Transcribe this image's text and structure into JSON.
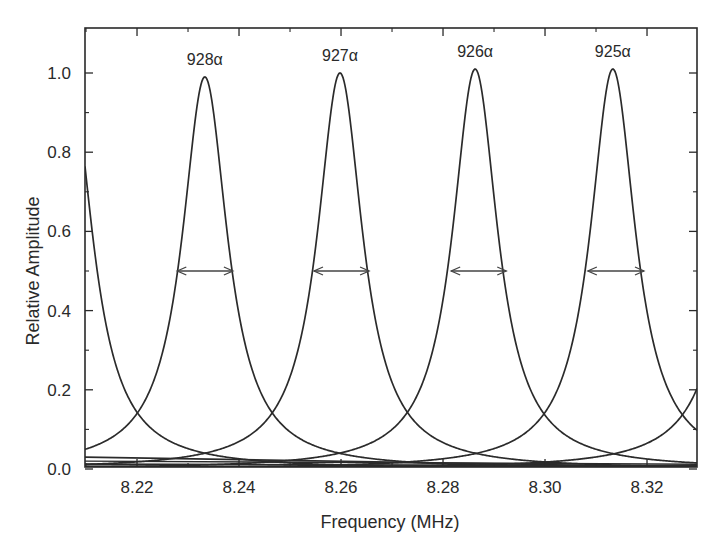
{
  "chart_data": {
    "type": "line",
    "title": "",
    "xlabel": "Frequency (MHz)",
    "ylabel": "Relative Amplitude",
    "xlim": [
      8.2098,
      8.3298
    ],
    "ylim": [
      0.0,
      1.11
    ],
    "x_ticks": [
      8.22,
      8.24,
      8.26,
      8.28,
      8.3,
      8.32
    ],
    "x_tick_labels": [
      "8.22",
      "8.24",
      "8.26",
      "8.28",
      "8.30",
      "8.32"
    ],
    "x_minor_ticks": [
      8.21,
      8.23,
      8.25,
      8.27,
      8.29,
      8.31
    ],
    "y_ticks": [
      0.0,
      0.2,
      0.4,
      0.6,
      0.8,
      1.0
    ],
    "y_tick_labels": [
      "0.0",
      "0.2",
      "0.4",
      "0.6",
      "0.8",
      "1.0"
    ],
    "y_minor_ticks": [
      0.1,
      0.3,
      0.5,
      0.7,
      0.9
    ],
    "grid": false,
    "legend": null,
    "line_shape": "lorentzian",
    "fwhm_mhz": 0.0108,
    "series": [
      {
        "name": "929α",
        "label_visible": false,
        "center": 8.2068,
        "peak": 1.0
      },
      {
        "name": "928α",
        "label_visible": true,
        "center": 8.2333,
        "peak": 0.99
      },
      {
        "name": "927α",
        "label_visible": true,
        "center": 8.2598,
        "peak": 1.0
      },
      {
        "name": "926α",
        "label_visible": true,
        "center": 8.2863,
        "peak": 1.01
      },
      {
        "name": "925α",
        "label_visible": true,
        "center": 8.3133,
        "peak": 1.01
      },
      {
        "name": "924α",
        "label_visible": false,
        "center": 8.3405,
        "peak": 1.0
      }
    ],
    "annotations": [
      {
        "type": "double-arrow",
        "y": 0.5,
        "x_from": 8.2279,
        "x_to": 8.2388,
        "note": "FWHM 928α"
      },
      {
        "type": "double-arrow",
        "y": 0.5,
        "x_from": 8.2547,
        "x_to": 8.2655,
        "note": "FWHM 927α"
      },
      {
        "type": "double-arrow",
        "y": 0.5,
        "x_from": 8.2816,
        "x_to": 8.2924,
        "note": "FWHM 926α"
      },
      {
        "type": "double-arrow",
        "y": 0.5,
        "x_from": 8.3084,
        "x_to": 8.3194,
        "note": "FWHM 925α"
      }
    ]
  }
}
